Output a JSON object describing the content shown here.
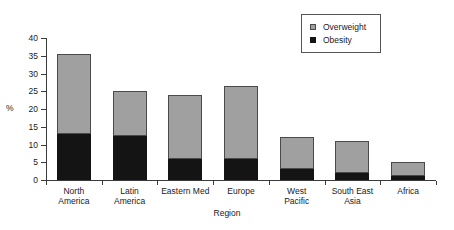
{
  "chart_data": {
    "type": "bar",
    "subtype": "stacked-bar",
    "title": "",
    "xlabel": "Region",
    "ylabel": "%",
    "ylim": [
      0,
      40
    ],
    "yticks": [
      0,
      5,
      10,
      15,
      20,
      25,
      30,
      35,
      40
    ],
    "grid": false,
    "legend_position": "top-right",
    "categories": [
      "North America",
      "Latin America",
      "Eastern Med",
      "Europe",
      "West Pacific",
      "South East Asia",
      "Africa"
    ],
    "category_lines": [
      [
        "North",
        "America"
      ],
      [
        "Latin",
        "America"
      ],
      [
        "Eastern Med",
        ""
      ],
      [
        "Europe",
        ""
      ],
      [
        "West",
        "Pacific"
      ],
      [
        "South East",
        "Asia"
      ],
      [
        "Africa",
        ""
      ]
    ],
    "series": [
      {
        "name": "Obesity",
        "color": "#141414",
        "values": [
          13,
          12.5,
          6,
          6,
          3,
          2,
          1
        ]
      },
      {
        "name": "Overweight",
        "color": "#a0a0a0",
        "values": [
          22.5,
          12.5,
          18,
          20.5,
          9,
          9,
          4
        ]
      }
    ],
    "totals": [
      35.5,
      25,
      24,
      26.5,
      12,
      11,
      5
    ]
  },
  "legend": {
    "items": [
      {
        "label": "Overweight",
        "swatch": "gray-square-icon"
      },
      {
        "label": "Obesity",
        "swatch": "black-square-icon"
      }
    ]
  },
  "axes": {
    "y": {
      "title": "%",
      "tick_labels": [
        "0",
        "5",
        "10",
        "15",
        "20",
        "25",
        "30",
        "35",
        "40"
      ]
    },
    "x": {
      "title": "Region"
    }
  }
}
